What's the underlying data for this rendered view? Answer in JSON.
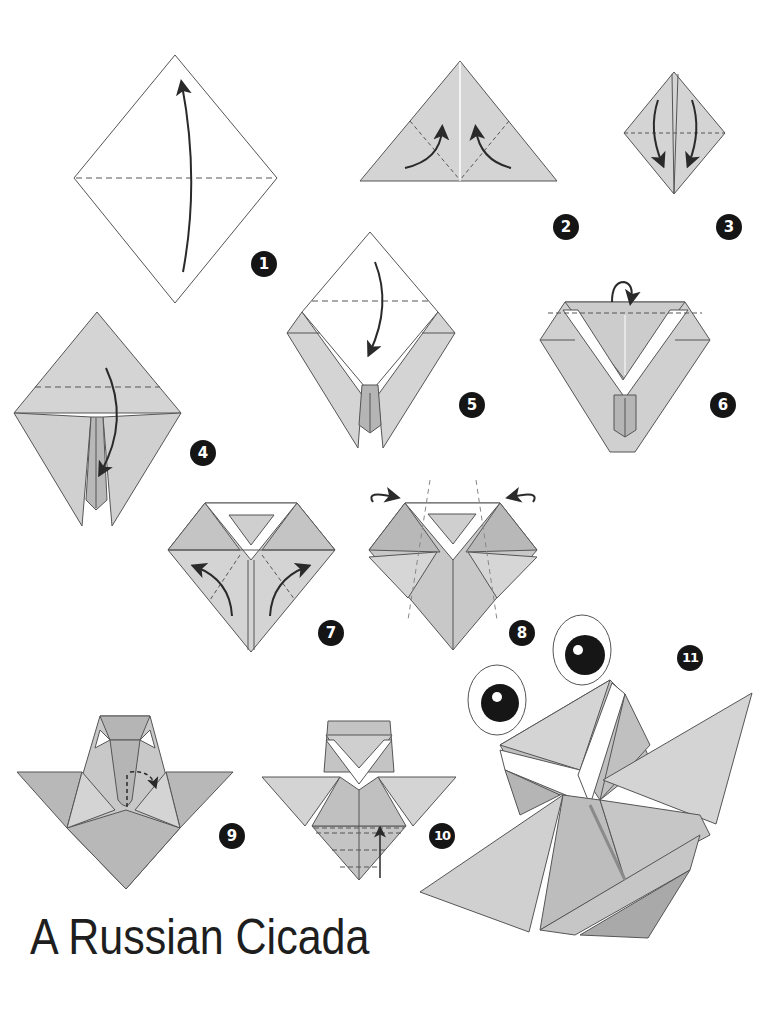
{
  "title": "A Russian Cicada",
  "colors": {
    "paper_light": "#d4d4d4",
    "paper_mid": "#c4c4c4",
    "paper_dark": "#a9a9a9",
    "line": "#4a4a4a",
    "badge_bg": "#151515",
    "badge_text": "#ffffff",
    "title_text": "#1e1e1e"
  },
  "steps": [
    {
      "number": "1",
      "description": "Square turned as diamond, fold bottom corner up to top along horizontal diagonal"
    },
    {
      "number": "2",
      "description": "Triangle, fold both bottom corners up to the top"
    },
    {
      "number": "3",
      "description": "Small diamond, fold the top flaps down"
    },
    {
      "number": "4",
      "description": "Fold the top layer down along dashed line"
    },
    {
      "number": "5",
      "description": "Fold the top corner down"
    },
    {
      "number": "6",
      "description": "Fold the tip back behind"
    },
    {
      "number": "7",
      "description": "Fold the lower flaps outward"
    },
    {
      "number": "8",
      "description": "Fold the sides behind along dashed lines"
    },
    {
      "number": "9",
      "description": "Crimp fold the center"
    },
    {
      "number": "10",
      "description": "Pleat fold the bottom upward"
    },
    {
      "number": "11",
      "description": "Finished cicada with eyes"
    }
  ]
}
